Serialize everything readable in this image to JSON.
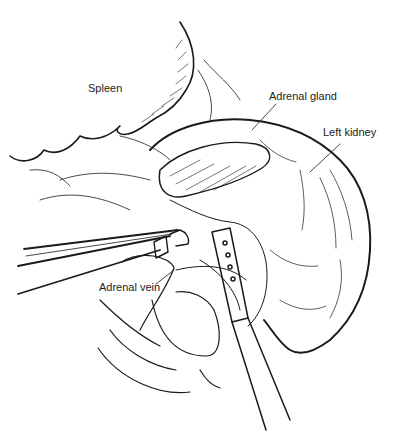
{
  "figure": {
    "labels": {
      "spleen": "Spleen",
      "adrenal_gland": "Adrenal gland",
      "left_kidney": "Left kidney",
      "adrenal_vein": "Adrenal vein"
    },
    "colors": {
      "ink": "#1a1a1a",
      "background": "#ffffff"
    }
  }
}
